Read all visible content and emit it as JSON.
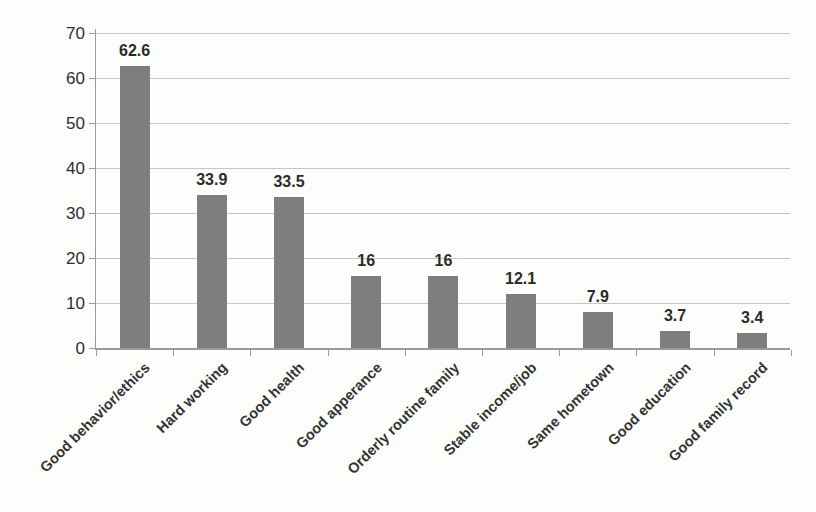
{
  "chart_data": {
    "type": "bar",
    "title": "",
    "xlabel": "",
    "ylabel": "",
    "categories": [
      "Good behavior/ethics",
      "Hard working",
      "Good health",
      "Good apperance",
      "Orderly routine family",
      "Stable income/job",
      "Same hometown",
      "Good education",
      "Good family record"
    ],
    "values": [
      62.6,
      33.9,
      33.5,
      16,
      16,
      12.1,
      7.9,
      3.7,
      3.4
    ],
    "value_labels": [
      "62.6",
      "33.9",
      "33.5",
      "16",
      "16",
      "12.1",
      "7.9",
      "3.7",
      "3.4"
    ],
    "ylim": [
      0,
      70
    ],
    "yticks": [
      0,
      10,
      20,
      30,
      40,
      50,
      60,
      70
    ],
    "grid": true,
    "legend_position": "none",
    "bar_color": "#7e7e7c",
    "gridline_color": "#c6c6c4",
    "axis_color": "#9a9a98",
    "text_color": "#2e2e2e"
  }
}
